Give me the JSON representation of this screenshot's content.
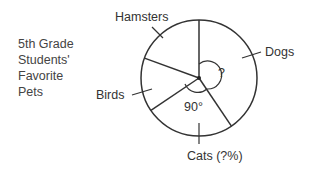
{
  "chart_data": {
    "type": "pie",
    "title_lines": [
      "5th Grade",
      "Students'",
      "Favorite",
      "Pets"
    ],
    "slices": [
      {
        "label": "Hamsters",
        "start_angle_deg": 0,
        "end_angle_deg": -70
      },
      {
        "label": "Birds",
        "start_angle_deg": -70,
        "end_angle_deg": -124
      },
      {
        "label": "Cats (?%)",
        "start_angle_deg": -124,
        "end_angle_deg": -214
      },
      {
        "label": "Dogs",
        "start_angle_deg": -214,
        "end_angle_deg": -360
      }
    ],
    "annotations": {
      "cats_angle": "90°",
      "dogs_angle": "?"
    }
  }
}
